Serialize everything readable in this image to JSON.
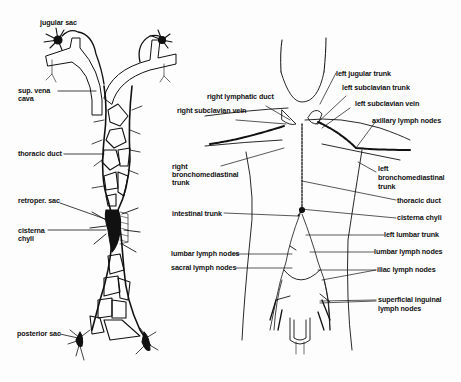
{
  "left_figure": {
    "labels": {
      "jugular_sac": "jugular sac",
      "sup_vena_cava_1": "sup. vena",
      "sup_vena_cava_2": "cava",
      "thoracic_duct": "thoracic duct",
      "retroper_sac": "retroper. sac",
      "cisterna_chyli_1": "cisterna",
      "cisterna_chyli_2": "chyli",
      "posterior_sac": "posterior sac"
    }
  },
  "right_figure": {
    "labels": {
      "left_jugular_trunk": "left jugular trunk",
      "right_lymphatic_duct": "right lymphatic duct",
      "left_subclavian_trunk": "left subclavian trunk",
      "right_subclavian_vein": "right subclavian vein",
      "left_subclavian_vein": "left subclavian vein",
      "axillary_lymph_nodes": "axillary lymph nodes",
      "right_bronchomediastinal_1": "right",
      "right_bronchomediastinal_2": "bronchomediastinal",
      "right_bronchomediastinal_3": "trunk",
      "left_bronchomediastinal_1": "left",
      "left_bronchomediastinal_2": "bronchomediastinal",
      "left_bronchomediastinal_3": "trunk",
      "thoracic_duct": "thoracic duct",
      "cisterna_chyli": "cisterna chyli",
      "intestinal_trunk": "intestinal trunk",
      "left_lumbar_trunk": "left lumbar trunk",
      "lumbar_lymph_nodes_left": "lumbar lymph nodes",
      "lumbar_lymph_nodes_right": "lumbar lymph nodes",
      "sacral_lymph_nodes": "sacral lymph nodes",
      "iliac_lymph_nodes": "iliac lymph nodes",
      "superficial_inguinal_1": "superficial inguinal",
      "superficial_inguinal_2": "lymph nodes"
    }
  }
}
